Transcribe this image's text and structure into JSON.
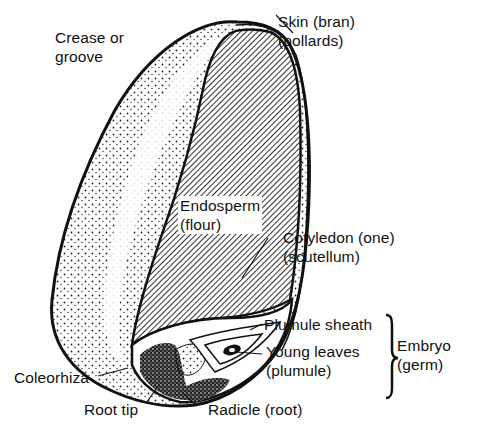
{
  "diagram": {
    "colors": {
      "ink": "#111111",
      "background": "#ffffff",
      "hatch": "#333333"
    },
    "labels": {
      "crease": [
        "Crease or",
        "groove"
      ],
      "skin": [
        "Skin (bran)",
        "(pollards)"
      ],
      "endosperm": [
        "Endosperm",
        "(flour)"
      ],
      "cotyledon": [
        "Cotyledon (one)",
        "(scutellum)"
      ],
      "plumule_sheath": "Plumule sheath",
      "young_leaves": [
        "Young leaves",
        "(plumule)"
      ],
      "embryo": [
        "Embryo",
        "(germ)"
      ],
      "coleorhiza": "Coleorhiza",
      "root_tip": "Root tip",
      "radicle": "Radicle (root)"
    }
  }
}
